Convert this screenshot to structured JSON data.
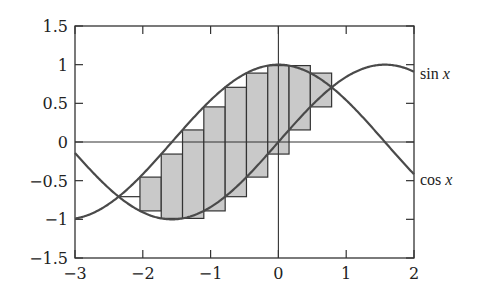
{
  "chart_data": {
    "type": "line",
    "title": "",
    "xlabel": "",
    "ylabel": "",
    "xlim": [
      -3,
      2
    ],
    "ylim": [
      -1.5,
      1.5
    ],
    "grid": false,
    "x_ticks": [
      -3,
      -2,
      -1,
      0,
      1,
      2
    ],
    "x_tick_labels": [
      "−3",
      "−2",
      "−1",
      "0",
      "1",
      "2"
    ],
    "y_ticks": [
      1.5,
      1,
      0.5,
      0,
      -0.5,
      -1,
      -1.5
    ],
    "y_tick_labels": [
      "1.5",
      "1",
      "0.5",
      "0",
      "−0.5",
      "−1",
      "−1.5"
    ],
    "reference_lines": {
      "x": 0,
      "y": 0
    },
    "series": [
      {
        "name": "sin x",
        "function": "sin",
        "label": "sin x",
        "label_func": "sin",
        "label_var": "x",
        "color": "#4a4a4a"
      },
      {
        "name": "cos x",
        "function": "cos",
        "label": "cos x",
        "label_func": "cos",
        "label_var": "x",
        "color": "#4a4a4a"
      }
    ],
    "riemann_bars": {
      "description": "Left-endpoint rectangles between sin x and cos x from -3π/4 to π/4, width π/10",
      "x_start": -2.356,
      "x_end": 0.785,
      "width": 0.314,
      "fill": "#c9c9c9",
      "stroke": "#333333",
      "bars": [
        {
          "x0": -2.356,
          "x1": -2.042,
          "bottom": -0.707,
          "top": -0.707
        },
        {
          "x0": -2.042,
          "x1": -1.728,
          "bottom": -0.891,
          "top": -0.454
        },
        {
          "x0": -1.728,
          "x1": -1.414,
          "bottom": -0.988,
          "top": -0.156
        },
        {
          "x0": -1.414,
          "x1": -1.1,
          "bottom": -0.988,
          "top": 0.156
        },
        {
          "x0": -1.1,
          "x1": -0.785,
          "bottom": -0.891,
          "top": 0.454
        },
        {
          "x0": -0.785,
          "x1": -0.471,
          "bottom": -0.707,
          "top": 0.707
        },
        {
          "x0": -0.471,
          "x1": -0.157,
          "bottom": -0.454,
          "top": 0.891
        },
        {
          "x0": -0.157,
          "x1": 0.157,
          "bottom": -0.156,
          "top": 0.988
        },
        {
          "x0": 0.157,
          "x1": 0.471,
          "bottom": 0.156,
          "top": 0.988
        },
        {
          "x0": 0.471,
          "x1": 0.785,
          "bottom": 0.454,
          "top": 0.891
        }
      ]
    }
  },
  "layout": {
    "plot_left": 75,
    "plot_right": 414,
    "plot_top": 26,
    "plot_bottom": 258
  }
}
